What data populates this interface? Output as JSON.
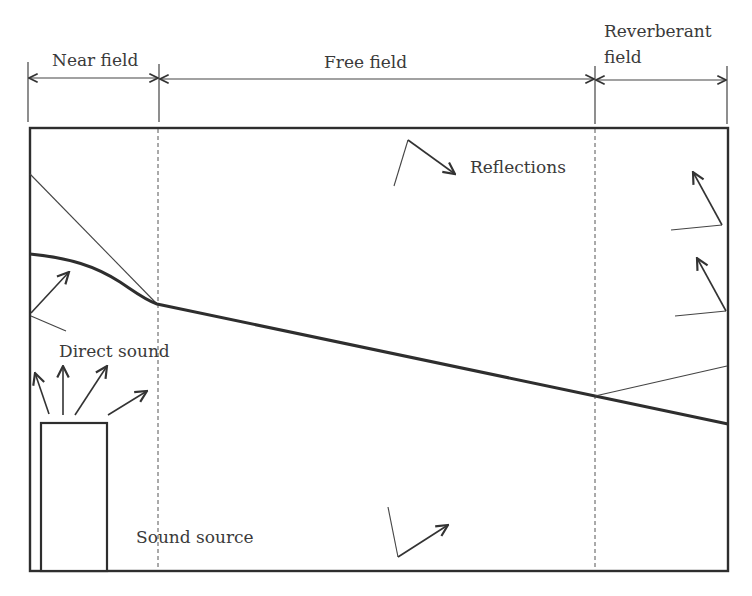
{
  "diagram": {
    "zones": [
      {
        "id": "near",
        "label": "Near field"
      },
      {
        "id": "free",
        "label": "Free field"
      },
      {
        "id": "reverberant",
        "label_line1": "Reverberant",
        "label_line2": "field"
      }
    ],
    "annotations": {
      "reflections": "Reflections",
      "direct_sound": "Direct sound",
      "sound_source": "Sound source"
    },
    "colors": {
      "stroke": "#2e2e2e",
      "text": "#3a3a3a",
      "background": "#ffffff"
    }
  }
}
